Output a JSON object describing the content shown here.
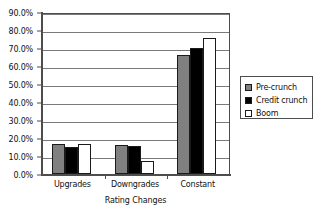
{
  "chart_data": {
    "type": "bar",
    "title": "",
    "xlabel": "Rating Changes",
    "ylabel": "",
    "categories": [
      "Upgrades",
      "Downgrades",
      "Constant"
    ],
    "series": [
      {
        "name": "Pre-crunch",
        "color": "#808080",
        "values": [
          17.0,
          16.2,
          66.8
        ]
      },
      {
        "name": "Credit crunch",
        "color": "#000000",
        "values": [
          15.0,
          15.8,
          70.2
        ]
      },
      {
        "name": "Boom",
        "color": "#ffffff",
        "values": [
          16.8,
          7.3,
          76.2
        ]
      }
    ],
    "ylim": [
      0,
      90
    ],
    "ytick_values": [
      0,
      10,
      20,
      30,
      40,
      50,
      60,
      70,
      80,
      90
    ],
    "ytick_labels": [
      "0.0%",
      "10.0%",
      "20.0%",
      "30.0%",
      "40.0%",
      "50.0%",
      "60.0%",
      "70.0%",
      "80.0%",
      "90.0%"
    ],
    "grid": true,
    "legend_position": "right"
  },
  "legend": {
    "entries": [
      {
        "label": "Pre-crunch"
      },
      {
        "label": "Credit crunch"
      },
      {
        "label": "Boom"
      }
    ]
  }
}
